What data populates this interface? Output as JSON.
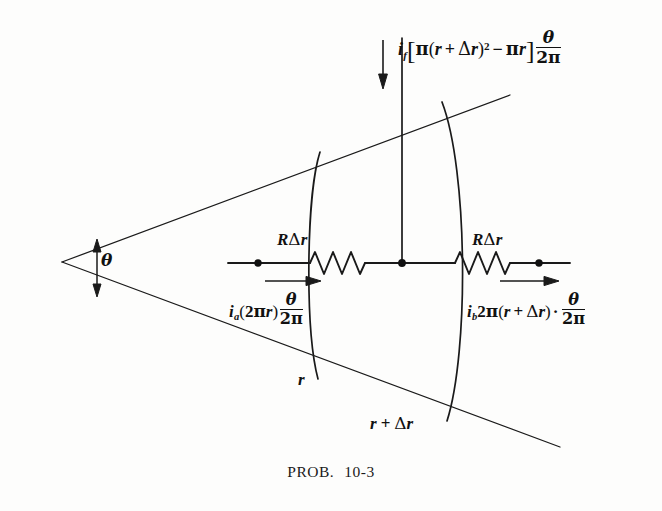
{
  "figure": {
    "caption_label": "PROB.",
    "caption_number": "10-3",
    "ink_color": "#111111",
    "background_color": "#fdfdfc"
  },
  "labels": {
    "flux_current": {
      "symbol": "i",
      "subscript": "f",
      "bracket_open": "[",
      "pi_1": "π",
      "paren_open": "(",
      "r": "r",
      "plus": "+",
      "delta": "Δ",
      "delta_r": "r",
      "paren_close": ")",
      "exponent": "2",
      "minus": "−",
      "pi_2": "π",
      "r_2": "r",
      "bracket_close": "]",
      "fraction_numerator": "θ",
      "fraction_denominator": "2π",
      "plain_text": "i_f[π(r + Δr)² − πr] θ/2π"
    },
    "resistor_left": {
      "R": "R",
      "delta": "Δ",
      "r": "r",
      "plain_text": "RΔr"
    },
    "resistor_right": {
      "R": "R",
      "delta": "Δ",
      "r": "r",
      "plain_text": "RΔr"
    },
    "current_a": {
      "symbol": "i",
      "subscript": "a",
      "paren_open": "(",
      "two": "2",
      "pi": "π",
      "r": "r",
      "paren_close": ")",
      "fraction_numerator": "θ",
      "fraction_denominator": "2π",
      "plain_text": "i_a(2πr) θ/2π"
    },
    "current_b": {
      "symbol": "i",
      "subscript": "b",
      "two": "2",
      "pi": "π",
      "paren_open": "(",
      "r": "r",
      "plus": "+",
      "delta": "Δ",
      "delta_r": "r",
      "paren_close": ")",
      "dot": "·",
      "fraction_numerator": "θ",
      "fraction_denominator": "2π",
      "plain_text": "i_b2π(r + Δr)· θ/2π"
    },
    "angle_theta": {
      "symbol": "θ"
    },
    "radius_inner": {
      "symbol": "r"
    },
    "radius_outer": {
      "r": "r",
      "plus": "+",
      "delta": "Δ",
      "delta_r": "r",
      "plain_text": "r + Δr"
    }
  }
}
